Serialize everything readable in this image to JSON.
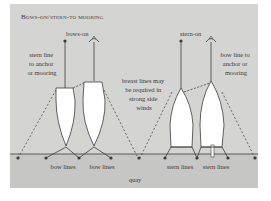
{
  "title": "Bows-on/stern-to mooring",
  "colors": {
    "panel": "#d4d4d2",
    "quay": "#c6c6c4",
    "line": "#3c3c3c",
    "boat": "#ffffff",
    "text": "#3a3a3a"
  },
  "labels": {
    "bows_on": "bows-on",
    "stern_on": "stern-on",
    "stern_line_1": "stern line",
    "stern_line_2": "to anchor",
    "stern_line_3": "or mooring",
    "bow_line_1": "bow line to",
    "bow_line_2": "anchor or",
    "bow_line_3": "mooring",
    "breast_1": "breast lines may",
    "breast_2": "be required in",
    "breast_3": "strong side",
    "breast_4": "winds",
    "bow_lines_a": "bow lines",
    "bow_lines_b": "bow lines",
    "stern_lines_a": "stern lines",
    "stern_lines_b": "stern lines",
    "quay": "quay"
  }
}
